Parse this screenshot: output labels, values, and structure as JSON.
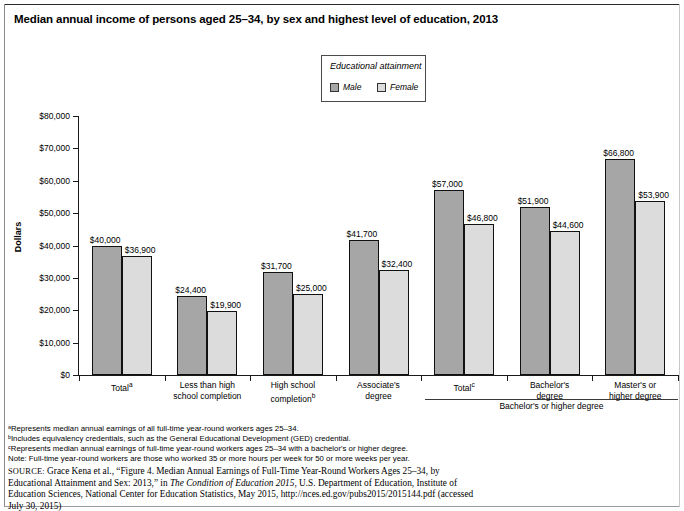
{
  "title": "Median annual income of persons aged 25–34, by sex and highest level of education, 2013",
  "legend": {
    "title": "Educational attainment",
    "male_label": "Male",
    "female_label": "Female",
    "male_color": "#a6a6a6",
    "female_color": "#dcdcdc"
  },
  "bracket": {
    "label": "Bachelor's or higher degree"
  },
  "notes": [
    "ᵃRepresents median annual earnings of all full-time year-round workers ages 25–34.",
    "ᵇIncludes equivalency credentials, such as the General Educational Development (GED) credential.",
    "ᶜRepresents median annual earnings of full-time year-round workers ages 25–34 with a bachelor's or higher degree.",
    "Note: Full-time year-round workers are those who worked 35 or more hours per week for 50 or more weeks per year."
  ],
  "source": {
    "prefix": "SOURCE:",
    "part1": " Grace Kena et al., “Figure 4. Median Annual Earnings of Full-Time Year-Round Workers Ages 25–34, by Educational Attainment and Sex: 2013,” in ",
    "italic": "The Condition of Education 2015",
    "part2": ", U.S. Department of Education, Institute of Education Sciences, National Center for Education Statistics, May 2015, http://nces.ed.gov/pubs2015/2015144.pdf (accessed July 30, 2015)"
  },
  "chart_data": {
    "type": "bar",
    "title": "Median annual income of persons aged 25–34, by sex and highest level of education, 2013",
    "xlabel": "",
    "ylabel": "Dollars",
    "ylim": [
      0,
      80000
    ],
    "ytick_values": [
      0,
      10000,
      20000,
      30000,
      40000,
      50000,
      60000,
      70000,
      80000
    ],
    "ytick_labels": [
      "$0",
      "$10,000",
      "$20,000",
      "$30,000",
      "$40,000",
      "$50,000",
      "$60,000",
      "$70,000",
      "$80,000"
    ],
    "grid": false,
    "legend_position": "top-center",
    "categories": [
      {
        "line1": "Total",
        "line2": "",
        "sup1": "a",
        "sup2": ""
      },
      {
        "line1": "Less than high",
        "line2": "school completion",
        "sup1": "",
        "sup2": ""
      },
      {
        "line1": "High school",
        "line2": "completion",
        "sup1": "",
        "sup2": "b"
      },
      {
        "line1": "Associate's",
        "line2": "degree",
        "sup1": "",
        "sup2": ""
      },
      {
        "line1": "Total",
        "line2": "",
        "sup1": "c",
        "sup2": ""
      },
      {
        "line1": "Bachelor's",
        "line2": "degree",
        "sup1": "",
        "sup2": ""
      },
      {
        "line1": "Master's or",
        "line2": "higher degree",
        "sup1": "",
        "sup2": ""
      }
    ],
    "series": [
      {
        "name": "Male",
        "values": [
          40000,
          24400,
          31700,
          41700,
          57000,
          51900,
          66800
        ],
        "labels": [
          "$40,000",
          "$24,400",
          "$31,700",
          "$41,700",
          "$57,000",
          "$51,900",
          "$66,800"
        ]
      },
      {
        "name": "Female",
        "values": [
          36900,
          19900,
          25000,
          32400,
          46800,
          44600,
          53900
        ],
        "labels": [
          "$36,900",
          "$19,900",
          "$25,000",
          "$32,400",
          "$46,800",
          "$44,600",
          "$53,900"
        ]
      }
    ]
  }
}
